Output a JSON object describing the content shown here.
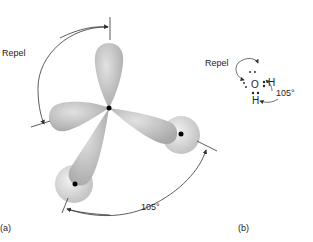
{
  "panel_a": {
    "label": "(a)",
    "repel_label": "Repel",
    "angle_label": "105°"
  },
  "panel_b": {
    "label": "(b)",
    "repel_label": "Repel",
    "angle_label": "105°",
    "atom_o": "O",
    "atom_h1": "H",
    "atom_h2": "H"
  },
  "colors": {
    "lobe": "#bdbdbd",
    "sphere": "#d6d6d6",
    "line": "#333333"
  }
}
